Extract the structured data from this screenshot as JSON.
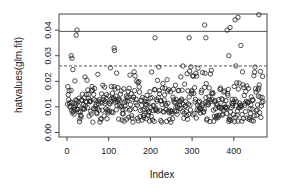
{
  "chart_data": {
    "type": "scatter",
    "title": "",
    "xlabel": "Index",
    "ylabel": "hatvalues(glm.fit)",
    "xlim": [
      0,
      470
    ],
    "ylim": [
      0,
      0.046
    ],
    "x_ticks": [
      "0",
      "100",
      "200",
      "300",
      "400"
    ],
    "x_tick_values": [
      0,
      100,
      200,
      300,
      400
    ],
    "y_ticks": [
      "0.00",
      "0.01",
      "0.02",
      "0.03",
      "0.04"
    ],
    "y_tick_values": [
      0,
      0.01,
      0.02,
      0.03,
      0.04
    ],
    "grid": false,
    "legend": null,
    "reference_lines": [
      {
        "y": 0.0395,
        "style": "solid",
        "color": "#555555"
      },
      {
        "y": 0.026,
        "style": "dashed",
        "color": "#555555"
      }
    ],
    "marker": "open-circle",
    "n_points": 470,
    "outliers": [
      {
        "x": 10,
        "y": 0.03
      },
      {
        "x": 12,
        "y": 0.029
      },
      {
        "x": 22,
        "y": 0.038
      },
      {
        "x": 24,
        "y": 0.04
      },
      {
        "x": 113,
        "y": 0.033
      },
      {
        "x": 114,
        "y": 0.032
      },
      {
        "x": 211,
        "y": 0.037
      },
      {
        "x": 293,
        "y": 0.037
      },
      {
        "x": 330,
        "y": 0.042
      },
      {
        "x": 333,
        "y": 0.037
      },
      {
        "x": 384,
        "y": 0.04
      },
      {
        "x": 388,
        "y": 0.03
      },
      {
        "x": 391,
        "y": 0.041
      },
      {
        "x": 403,
        "y": 0.044
      },
      {
        "x": 405,
        "y": 0.026
      },
      {
        "x": 410,
        "y": 0.045
      },
      {
        "x": 417,
        "y": 0.034
      },
      {
        "x": 460,
        "y": 0.046
      }
    ],
    "bulk_distribution": {
      "x_range": [
        1,
        470
      ],
      "y_min": 0.003,
      "y_max": 0.026,
      "y_typical": 0.011
    }
  }
}
